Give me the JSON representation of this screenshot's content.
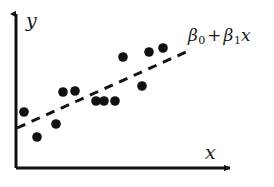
{
  "chart_data": {
    "type": "scatter",
    "title": "",
    "subtitle": "",
    "xlabel": "x",
    "ylabel": "y",
    "grid": false,
    "legend_position": "none",
    "xlim": [
      0,
      100
    ],
    "ylim": [
      0,
      100
    ],
    "axis_ticks": {
      "x": [],
      "y": []
    },
    "annotations": [
      {
        "name": "regression-line-label",
        "text": "β0 + β1x",
        "beta0": "β",
        "beta0_sub": "0",
        "operator": "+",
        "beta1": "β",
        "beta1_sub": "1",
        "variable": "x",
        "x_px": 188,
        "y_px": 27
      }
    ],
    "series": [
      {
        "name": "observations",
        "type": "scatter",
        "marker": "filled-circle",
        "color": "#111111",
        "marker_size_px": 9,
        "points": [
          {
            "x": 4.3,
            "y": 35.4,
            "px": 24,
            "py": 112
          },
          {
            "x": 10.2,
            "y": 19.6,
            "px": 37,
            "py": 137
          },
          {
            "x": 18.8,
            "y": 27.8,
            "px": 56,
            "py": 124
          },
          {
            "x": 21.7,
            "y": 48.7,
            "px": 63,
            "py": 92
          },
          {
            "x": 27.1,
            "y": 49.4,
            "px": 75,
            "py": 91
          },
          {
            "x": 36.7,
            "y": 42.4,
            "px": 96,
            "py": 101
          },
          {
            "x": 40.3,
            "y": 42.4,
            "px": 104,
            "py": 101
          },
          {
            "x": 45.3,
            "y": 42.4,
            "px": 115,
            "py": 101
          },
          {
            "x": 48.9,
            "y": 70.3,
            "px": 123,
            "py": 57
          },
          {
            "x": 57.5,
            "y": 51.9,
            "px": 142,
            "py": 86
          },
          {
            "x": 60.0,
            "y": 73.4,
            "px": 149,
            "py": 52
          },
          {
            "x": 66.4,
            "y": 75.9,
            "px": 163,
            "py": 48
          }
        ]
      },
      {
        "name": "fitted-regression-line",
        "type": "line",
        "style": "dashed",
        "color": "#111111",
        "width_px": 3,
        "dash_pattern": "9 7",
        "endpoints": [
          {
            "x": 0.5,
            "y": 25.3,
            "px": 17,
            "py": 128
          },
          {
            "x": 76.8,
            "y": 73.4,
            "px": 186,
            "py": 52
          }
        ]
      }
    ],
    "axes": {
      "y_axis": {
        "from_px": [
          16,
          168
        ],
        "to_px": [
          16,
          12
        ],
        "arrow": true,
        "color": "#111111",
        "width_px": 3
      },
      "x_axis": {
        "from_px": [
          16,
          168
        ],
        "to_px": [
          232,
          168
        ],
        "arrow": true,
        "color": "#111111",
        "width_px": 3
      }
    },
    "colors": {
      "background": "#ffffff",
      "foreground": "#111111",
      "marker": "#111111",
      "line": "#111111"
    }
  }
}
